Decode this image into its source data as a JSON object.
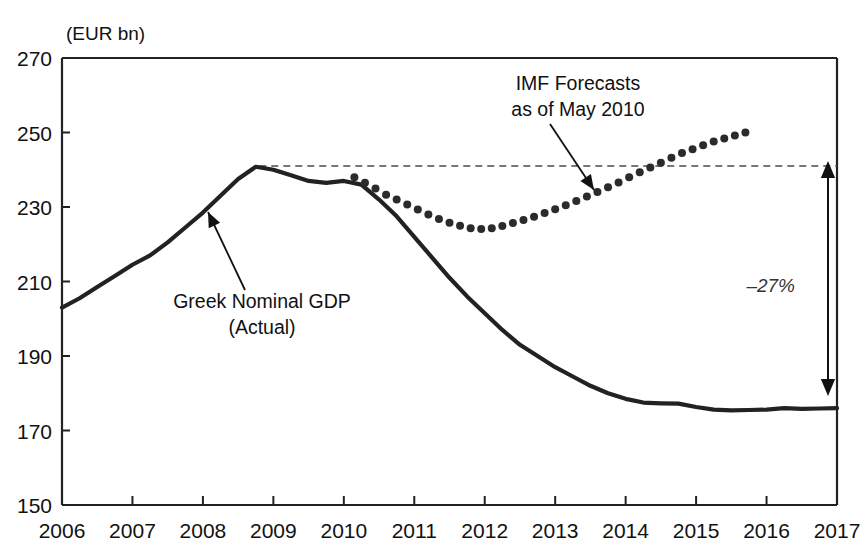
{
  "chart_data": {
    "type": "line",
    "title": "",
    "unit_label": "(EUR bn)",
    "xlabel": "",
    "ylabel": "",
    "xlim": [
      2006,
      2017
    ],
    "ylim": [
      150,
      270
    ],
    "ytick_labels": [
      "270",
      "250",
      "230",
      "210",
      "190",
      "170",
      "150"
    ],
    "yticks": [
      270,
      250,
      230,
      210,
      190,
      170,
      150
    ],
    "xtick_labels": [
      "2006",
      "2007",
      "2008",
      "2009",
      "2010",
      "2011",
      "2012",
      "2013",
      "2014",
      "2015",
      "2016",
      "2017"
    ],
    "xticks": [
      2006,
      2007,
      2008,
      2009,
      2010,
      2011,
      2012,
      2013,
      2014,
      2015,
      2016,
      2017
    ],
    "grid": false,
    "legend_position": "inline-annotations",
    "series": [
      {
        "name": "Greek Nominal GDP (Actual)",
        "style": "solid",
        "color": "#222222",
        "x": [
          2006.0,
          2006.25,
          2006.5,
          2006.75,
          2007.0,
          2007.25,
          2007.5,
          2007.75,
          2008.0,
          2008.25,
          2008.5,
          2008.75,
          2009.0,
          2009.25,
          2009.5,
          2009.75,
          2010.0,
          2010.25,
          2010.5,
          2010.75,
          2011.0,
          2011.25,
          2011.5,
          2011.75,
          2012.0,
          2012.25,
          2012.5,
          2012.75,
          2013.0,
          2013.25,
          2013.5,
          2013.75,
          2014.0,
          2014.25,
          2014.5,
          2014.75,
          2015.0,
          2015.25,
          2015.5,
          2015.75,
          2016.0,
          2016.25,
          2016.5,
          2016.75,
          2017.0
        ],
        "values": [
          203.0,
          205.5,
          208.5,
          211.5,
          214.5,
          217.0,
          220.5,
          224.5,
          228.5,
          233.0,
          237.5,
          240.8,
          240.0,
          238.5,
          237.0,
          236.5,
          237.0,
          236.0,
          232.0,
          227.5,
          222.0,
          216.5,
          211.0,
          206.0,
          201.5,
          197.0,
          193.0,
          190.0,
          187.0,
          184.5,
          182.0,
          180.0,
          178.5,
          177.5,
          177.3,
          177.2,
          176.3,
          175.6,
          175.4,
          175.5,
          175.6,
          176.0,
          175.8,
          175.9,
          176.0
        ]
      },
      {
        "name": "IMF Forecasts as of May 2010",
        "style": "dotted",
        "color": "#2b2b2b",
        "x": [
          2010.15,
          2010.3,
          2010.45,
          2010.6,
          2010.75,
          2010.9,
          2011.05,
          2011.2,
          2011.35,
          2011.5,
          2011.65,
          2011.8,
          2011.95,
          2012.1,
          2012.25,
          2012.4,
          2012.55,
          2012.7,
          2012.85,
          2013.0,
          2013.15,
          2013.3,
          2013.45,
          2013.6,
          2013.75,
          2013.9,
          2014.05,
          2014.2,
          2014.35,
          2014.5,
          2014.65,
          2014.8,
          2014.95,
          2015.1,
          2015.25,
          2015.4,
          2015.55,
          2015.7
        ],
        "values": [
          238.0,
          236.5,
          235.0,
          233.3,
          232.0,
          230.7,
          229.3,
          228.0,
          226.8,
          225.8,
          225.0,
          224.3,
          224.1,
          224.3,
          224.9,
          225.7,
          226.5,
          227.4,
          228.4,
          229.4,
          230.5,
          231.6,
          232.8,
          234.0,
          235.3,
          236.6,
          238.0,
          239.3,
          240.6,
          241.9,
          243.2,
          244.5,
          245.5,
          246.6,
          247.6,
          248.4,
          249.2,
          250.0
        ]
      }
    ],
    "reference_line": {
      "name": "peak-level-dashed",
      "value": 241,
      "style": "dashed",
      "x_start": 2008.8,
      "x_end": 2017.0
    },
    "annotations": [
      {
        "id": "actual-label",
        "lines": [
          "Greek Nominal GDP",
          "(Actual)"
        ],
        "text_x": 262,
        "text_y": 308,
        "arrow_from": [
          245,
          290
        ],
        "arrow_to": [
          208,
          212
        ]
      },
      {
        "id": "imf-label",
        "lines": [
          "IMF Forecasts",
          "as of May 2010"
        ],
        "text_x": 578,
        "text_y": 90,
        "arrow_from": [
          550,
          124
        ],
        "arrow_to": [
          594,
          190
        ]
      },
      {
        "id": "gap-label",
        "text": "–27%",
        "text_x": 795,
        "text_y": 292,
        "arrow_top": [
          828,
          161
        ],
        "arrow_bottom": [
          828,
          396
        ]
      }
    ]
  }
}
